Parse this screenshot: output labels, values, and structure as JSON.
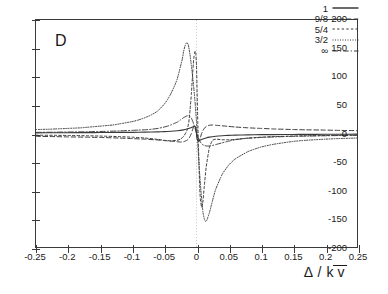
{
  "panel": {
    "label": "D"
  },
  "axes": {
    "x": {
      "title_delta": "Δ",
      "title_sep": " / ",
      "title_k": "k",
      "title_v": "v",
      "min": -0.25,
      "max": 0.25,
      "ticks": [
        -0.25,
        -0.2,
        -0.15,
        -0.1,
        -0.05,
        0,
        0.05,
        0.1,
        0.15,
        0.2,
        0.25
      ],
      "tick_labels": [
        "-0.25",
        "-0.2",
        "-0.15",
        "-0.1",
        "-0.05",
        "0",
        "0.05",
        "0.1",
        "0.15",
        "0.2",
        "0.25"
      ]
    },
    "y": {
      "title": "",
      "min": -200,
      "max": 200,
      "ticks": [
        200,
        150,
        100,
        50,
        0,
        -50,
        -100,
        -150,
        -200
      ],
      "tick_labels": [
        "200",
        "150",
        "100",
        "50",
        "0",
        "-50",
        "-100",
        "-150",
        "-200"
      ]
    }
  },
  "legend": {
    "position": "top-right-inside",
    "entries": [
      {
        "label": "1",
        "dash": "none",
        "key": "solid-line-key"
      },
      {
        "label": "9/8",
        "dash": "4.5,2.6",
        "key": "dashed-line-key"
      },
      {
        "label": "5/4",
        "dash": "2.4,2.2",
        "key": "fine-dashed-line-key"
      },
      {
        "label": "3/2",
        "dash": "1,1.5",
        "key": "dotted-line-key"
      },
      {
        "label": "∞",
        "dash": "5.5,2,1.2,2",
        "key": "dash-dot-line-key"
      }
    ]
  },
  "colors": {
    "ink": "#3a3a3a",
    "text": "#1a1a1a",
    "guide": "#bdbdbd"
  },
  "reference_line": {
    "x": 0,
    "style": "dotted",
    "name": "zero-reference-line"
  },
  "chart_data": {
    "type": "line",
    "title": "D",
    "xlabel": "Δ / k v̄",
    "ylabel": "",
    "xlim": [
      -0.25,
      0.25
    ],
    "ylim": [
      -200,
      200
    ],
    "grid": false,
    "legend_position": "upper right",
    "series": [
      {
        "name": "1",
        "dash": "none",
        "x": [
          -0.25,
          -0.22,
          -0.2,
          -0.17,
          -0.15,
          -0.12,
          -0.1,
          -0.08,
          -0.06,
          -0.05,
          -0.04,
          -0.03,
          -0.02,
          -0.015,
          -0.01,
          -0.007,
          -0.005,
          -0.003,
          -0.001,
          0,
          0.001,
          0.003,
          0.005,
          0.007,
          0.01,
          0.015,
          0.02,
          0.03,
          0.04,
          0.05,
          0.06,
          0.08,
          0.1,
          0.12,
          0.15,
          0.17,
          0.2,
          0.22,
          0.25
        ],
        "values": [
          1.2,
          1.3,
          1.4,
          1.5,
          1.7,
          1.9,
          2.1,
          2.4,
          2.9,
          3.3,
          3.9,
          4.8,
          6.4,
          7.8,
          9.6,
          11,
          12,
          12.5,
          10,
          0,
          -10,
          -12.5,
          -12,
          -11,
          -9.6,
          -7.8,
          -6.4,
          -4.8,
          -3.9,
          -3.3,
          -2.9,
          -2.4,
          -2.1,
          -1.9,
          -1.7,
          -1.5,
          -1.4,
          -1.3,
          -1.2
        ]
      },
      {
        "name": "9/8",
        "dash": "4.5,2.6",
        "x": [
          -0.25,
          -0.22,
          -0.2,
          -0.17,
          -0.15,
          -0.12,
          -0.1,
          -0.08,
          -0.06,
          -0.05,
          -0.04,
          -0.03,
          -0.025,
          -0.02,
          -0.015,
          -0.012,
          -0.01,
          -0.008,
          -0.006,
          -0.004,
          -0.002,
          0,
          0.002,
          0.004,
          0.006,
          0.008,
          0.01,
          0.012,
          0.015,
          0.02,
          0.025,
          0.03,
          0.04,
          0.05,
          0.06,
          0.08,
          0.1,
          0.12,
          0.15,
          0.17,
          0.2,
          0.22,
          0.25
        ],
        "values": [
          -5,
          -5.5,
          -6,
          -6.5,
          -7,
          -8,
          -9,
          -10,
          -11.5,
          -12.5,
          -13.5,
          -14.5,
          -15,
          -14.5,
          -12,
          -9,
          -5,
          0,
          7,
          14,
          12,
          0,
          -12,
          -14,
          -7,
          0,
          5,
          9,
          12,
          14.5,
          15,
          14.5,
          13.5,
          12.5,
          11.5,
          10,
          9,
          8,
          7,
          6.5,
          6,
          5.5,
          5
        ]
      },
      {
        "name": "5/4",
        "dash": "2.4,2.2",
        "x": [
          -0.25,
          -0.22,
          -0.2,
          -0.17,
          -0.15,
          -0.12,
          -0.1,
          -0.08,
          -0.06,
          -0.05,
          -0.04,
          -0.03,
          -0.025,
          -0.02,
          -0.015,
          -0.012,
          -0.01,
          -0.008,
          -0.006,
          -0.005,
          -0.004,
          -0.003,
          -0.002,
          -0.001,
          0,
          0.001,
          0.002,
          0.003,
          0.004,
          0.005,
          0.006,
          0.008,
          0.01,
          0.012,
          0.015,
          0.02,
          0.025,
          0.03,
          0.04,
          0.05,
          0.06,
          0.08,
          0.1,
          0.12,
          0.15,
          0.17,
          0.2,
          0.22,
          0.25
        ],
        "values": [
          -3,
          -3.2,
          -3.5,
          -4,
          -4.5,
          -5.5,
          -6.5,
          -8,
          -10.5,
          -12,
          -13,
          -12,
          -10,
          -5,
          5,
          20,
          42,
          70,
          105,
          122,
          134,
          142,
          145,
          140,
          120,
          70,
          20,
          -20,
          -60,
          -95,
          -115,
          -130,
          -120,
          -95,
          -60,
          -25,
          -12,
          -10,
          -11,
          -11,
          -10.5,
          -8,
          -6.5,
          -5.5,
          -4.5,
          -4,
          -3.5,
          -3.2,
          -3
        ]
      },
      {
        "name": "3/2",
        "dash": "1,1.5",
        "x": [
          -0.25,
          -0.23,
          -0.22,
          -0.2,
          -0.18,
          -0.17,
          -0.15,
          -0.13,
          -0.12,
          -0.1,
          -0.09,
          -0.08,
          -0.07,
          -0.06,
          -0.05,
          -0.045,
          -0.04,
          -0.035,
          -0.03,
          -0.025,
          -0.022,
          -0.02,
          -0.018,
          -0.016,
          -0.015,
          -0.013,
          -0.012,
          -0.01,
          -0.008,
          -0.006,
          -0.004,
          -0.002,
          0,
          0.002,
          0.004,
          0.006,
          0.008,
          0.01,
          0.012,
          0.014,
          0.016,
          0.02,
          0.025,
          0.03,
          0.04,
          0.05,
          0.06,
          0.08,
          0.1,
          0.12,
          0.15,
          0.17,
          0.2,
          0.22,
          0.25
        ],
        "values": [
          7,
          7.5,
          8,
          9,
          10,
          11,
          13,
          15,
          17,
          21,
          24,
          28,
          33,
          40,
          52,
          60,
          70,
          82,
          96,
          118,
          132,
          145,
          154,
          159,
          160,
          157,
          152,
          138,
          120,
          100,
          78,
          52,
          20,
          -18,
          -55,
          -88,
          -115,
          -138,
          -150,
          -155,
          -153,
          -140,
          -118,
          -98,
          -72,
          -56,
          -45,
          -32,
          -24,
          -19,
          -14,
          -12,
          -10,
          -9,
          -8
        ]
      },
      {
        "name": "∞",
        "dash": "5.5,2,1.2,2",
        "x": [
          -0.25,
          -0.22,
          -0.2,
          -0.17,
          -0.15,
          -0.12,
          -0.1,
          -0.09,
          -0.08,
          -0.07,
          -0.06,
          -0.05,
          -0.045,
          -0.04,
          -0.035,
          -0.03,
          -0.025,
          -0.02,
          -0.015,
          -0.012,
          -0.01,
          -0.008,
          -0.006,
          -0.004,
          -0.002,
          0,
          0.002,
          0.004,
          0.006,
          0.008,
          0.01,
          0.012,
          0.015,
          0.02,
          0.025,
          0.03,
          0.035,
          0.04,
          0.05,
          0.06,
          0.07,
          0.08,
          0.1,
          0.12,
          0.15,
          0.17,
          0.2,
          0.22,
          0.25
        ],
        "values": [
          2,
          2.3,
          2.6,
          3,
          3.5,
          4.5,
          5.5,
          6,
          6.5,
          7.5,
          9,
          11.5,
          13,
          15,
          17.5,
          20,
          24,
          28,
          31,
          31.5,
          30,
          27,
          22,
          15,
          8,
          0,
          -6,
          -11,
          -15,
          -18,
          -20,
          -21,
          -22,
          -22,
          -21,
          -19.5,
          -18,
          -16.5,
          -13.5,
          -11,
          -9.5,
          -8.5,
          -7,
          -6,
          -5,
          -4.5,
          -4,
          -3.6,
          -3.2
        ]
      }
    ]
  }
}
